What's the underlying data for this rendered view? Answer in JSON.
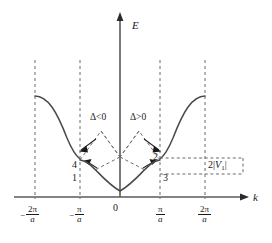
{
  "figure": {
    "type": "diagram",
    "axes": {
      "y_label": "E",
      "x_label": "k",
      "origin_label": "0"
    },
    "x_ticks": [
      {
        "id": "neg-2pi-a",
        "sign": "−",
        "numerator": "2π",
        "denominator": "a"
      },
      {
        "id": "neg-pi-a",
        "sign": "−",
        "numerator": "π",
        "denominator": "a"
      },
      {
        "id": "pos-pi-a",
        "sign": "",
        "numerator": "π",
        "denominator": "a"
      },
      {
        "id": "pos-2pi-a",
        "sign": "",
        "numerator": "2π",
        "denominator": "a"
      }
    ],
    "annotations": {
      "delta_negative": "Δ<0",
      "delta_positive": "Δ>0",
      "gap_prefix": "2|",
      "gap_symbol": "V",
      "gap_subscript": "1",
      "gap_suffix": "|",
      "gap_full": "2|V₁|"
    },
    "points": [
      {
        "id": "point-1",
        "label": "1"
      },
      {
        "id": "point-2",
        "label": "2"
      },
      {
        "id": "point-3",
        "label": "3"
      },
      {
        "id": "point-4",
        "label": "4"
      }
    ],
    "colors": {
      "ink": "#1a1a1a",
      "curve": "#4a4a4a",
      "dashed": "#6b6b6b",
      "axis": "#5a5a5a",
      "background": "#ffffff"
    }
  }
}
